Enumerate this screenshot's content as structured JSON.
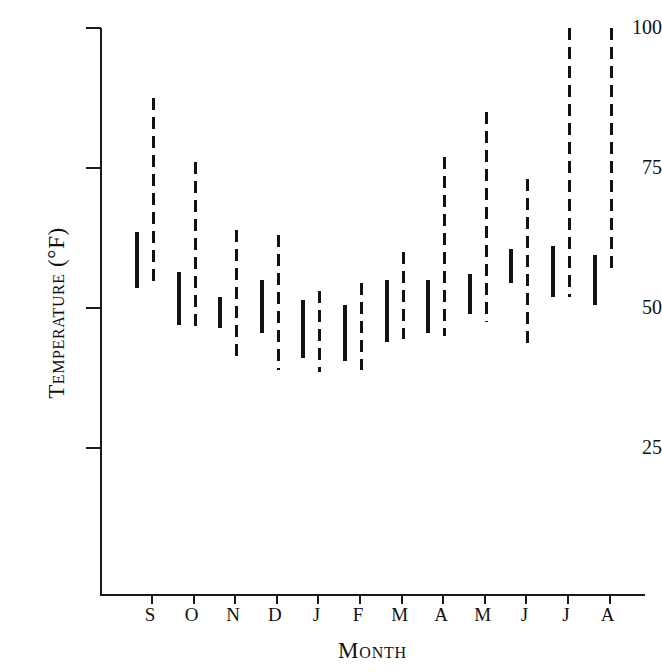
{
  "chart_data": {
    "type": "bar",
    "title": "",
    "subtitle": "",
    "xlabel": "Month",
    "ylabel": "Temperature (°F)",
    "ylim": [
      0,
      100
    ],
    "yticks": [
      25,
      50,
      75,
      100
    ],
    "ytick_labels": [
      "25",
      "50",
      "75",
      "100"
    ],
    "grid": false,
    "legend": null,
    "categories": [
      "S",
      "O",
      "N",
      "D",
      "J",
      "F",
      "M",
      "A",
      "M",
      "J",
      "J",
      "A"
    ],
    "category_names": [
      "September",
      "October",
      "November",
      "December",
      "January",
      "February",
      "March",
      "April",
      "May",
      "June",
      "July",
      "August"
    ],
    "series": [
      {
        "name": "mean range",
        "style": "solid",
        "low": [
          53.5,
          47.0,
          46.5,
          45.5,
          41.0,
          40.5,
          44.0,
          45.5,
          49.0,
          54.5,
          52.0,
          50.5
        ],
        "high": [
          63.5,
          56.5,
          52.0,
          55.0,
          51.5,
          50.5,
          55.0,
          55.0,
          56.0,
          60.5,
          61.0,
          59.5
        ]
      },
      {
        "name": "extreme range",
        "style": "dashed",
        "low": [
          54.5,
          45.5,
          41.0,
          39.0,
          38.5,
          39.0,
          44.5,
          45.0,
          47.5,
          43.5,
          52.0,
          56.5
        ],
        "high": [
          87.5,
          76.0,
          64.0,
          63.0,
          53.0,
          54.5,
          60.0,
          77.0,
          85.0,
          73.0,
          100.0,
          100.0
        ]
      }
    ]
  },
  "axes": {
    "y_title": "Temperature (°F)",
    "x_title": "Month"
  }
}
